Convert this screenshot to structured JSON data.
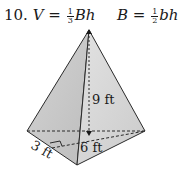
{
  "problem": {
    "number": "10.",
    "volume_formula": {
      "lhs": "V",
      "eq": "=",
      "frac_num": "1",
      "frac_den": "3",
      "rhs": "Bh"
    },
    "base_formula": {
      "lhs": "B",
      "eq": "=",
      "frac_num": "1",
      "frac_den": "2",
      "rhs": "bh"
    }
  },
  "figure": {
    "shape": "triangular pyramid",
    "height_label": "9 ft",
    "base_height_label": "6 ft",
    "base_side_label": "3 ft",
    "fill_color": "#c8c8c8",
    "edge_color": "#2a2a2a"
  }
}
